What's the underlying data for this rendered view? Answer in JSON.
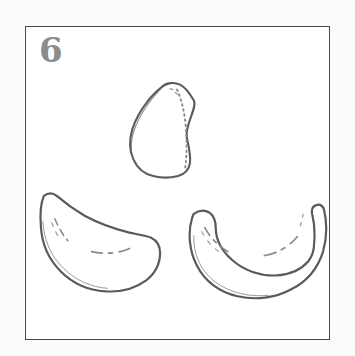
{
  "figure": {
    "kind": "instructional-line-drawing",
    "step_number": "6",
    "frame": {
      "border_color": "#4a4a4a",
      "fill_color": "#ffffff",
      "x": 25,
      "y": 26,
      "width": 305,
      "height": 314
    },
    "page_background": "#fbfbfb",
    "ink_color": "#5a5a5a",
    "detail_color": "#8a8a8a",
    "step_number_color": "#8c8c8c"
  },
  "shapes": [
    {
      "id": "teardrop",
      "name": "pear-teardrop-shape",
      "label": "teardrop",
      "position": "top-center",
      "bbox": {
        "x": 128,
        "y": 85,
        "width": 62,
        "height": 93
      },
      "interior_marks": "dotted-seam-right-edge"
    },
    {
      "id": "crescent-left",
      "name": "crescent-bowl-shape-left",
      "label": "crescent",
      "position": "bottom-left",
      "bbox": {
        "x": 40,
        "y": 192,
        "width": 118,
        "height": 95
      },
      "interior_marks": "short-dash-creases"
    },
    {
      "id": "crescent-right",
      "name": "crescent-bowl-shape-right",
      "label": "crescent",
      "position": "bottom-right",
      "bbox": {
        "x": 190,
        "y": 205,
        "width": 123,
        "height": 92
      },
      "interior_marks": "short-dash-creases"
    }
  ]
}
